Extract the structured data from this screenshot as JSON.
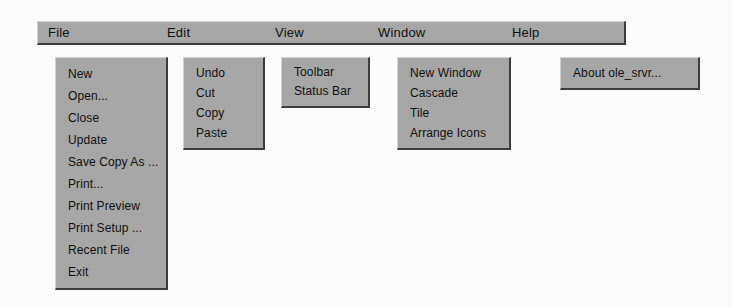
{
  "app": {
    "name": "ole_srvr"
  },
  "colors": {
    "menu_face": "#a9a9a9",
    "menu_highlight": "#d6d6d6",
    "menu_shadow": "#3d3d3d",
    "text": "#101010",
    "background": "#ffffff"
  },
  "menubar": {
    "items": [
      {
        "label": "File"
      },
      {
        "label": "Edit"
      },
      {
        "label": "View"
      },
      {
        "label": "Window"
      },
      {
        "label": "Help"
      }
    ]
  },
  "menus": {
    "file": {
      "title": "File",
      "items": [
        {
          "label": "New"
        },
        {
          "label": "Open..."
        },
        {
          "label": "Close"
        },
        {
          "label": "Update"
        },
        {
          "label": "Save Copy As ..."
        },
        {
          "label": "Print..."
        },
        {
          "label": "Print Preview"
        },
        {
          "label": "Print Setup ..."
        },
        {
          "label": "Recent File"
        },
        {
          "label": "Exit"
        }
      ]
    },
    "edit": {
      "title": "Edit",
      "items": [
        {
          "label": "Undo"
        },
        {
          "label": "Cut"
        },
        {
          "label": "Copy"
        },
        {
          "label": "Paste"
        }
      ]
    },
    "view": {
      "title": "View",
      "items": [
        {
          "label": "Toolbar"
        },
        {
          "label": "Status Bar"
        }
      ]
    },
    "window": {
      "title": "Window",
      "items": [
        {
          "label": "New Window"
        },
        {
          "label": "Cascade"
        },
        {
          "label": "Tile"
        },
        {
          "label": "Arrange Icons"
        }
      ]
    },
    "help": {
      "title": "Help",
      "items": [
        {
          "label": "About ole_srvr..."
        }
      ]
    }
  }
}
